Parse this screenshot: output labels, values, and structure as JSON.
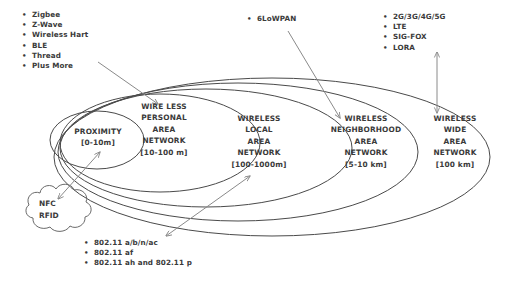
{
  "diagram": {
    "zones": [
      {
        "id": "proximity",
        "lines": [
          "PROXIMITY",
          "[0-10m]"
        ]
      },
      {
        "id": "wpan",
        "lines": [
          "WIRE LESS",
          "PERSONAL",
          "AREA",
          "NETWORK",
          "[10-100 m]"
        ]
      },
      {
        "id": "wlan",
        "lines": [
          "WIRELESS",
          "LOCAL",
          "AREA",
          "NETWORK",
          "[100-1000m]"
        ]
      },
      {
        "id": "wnan",
        "lines": [
          "WIRELESS",
          "NEIGHBORHOOD",
          "AREA",
          "NETWORK",
          "[5-10 km]"
        ]
      },
      {
        "id": "wwan",
        "lines": [
          "WIRELESS",
          "WIDE",
          "AREA",
          "NETWORK",
          "[100 km]"
        ]
      }
    ],
    "cloud": {
      "id": "nfc-rfid-cloud",
      "lines": [
        "NFC",
        "RFID"
      ]
    },
    "lists": {
      "wpan_technologies": {
        "bullet": "•",
        "items": [
          "Zigbee",
          "Z-Wave",
          "Wireless Hart",
          "BLE",
          "Thread",
          "Plus More"
        ]
      },
      "wnan_technologies": {
        "bullet": "•",
        "items": [
          "6LoWPAN"
        ]
      },
      "wwan_technologies": {
        "bullet": "•",
        "items": [
          "2G/3G/4G/5G",
          "LTE",
          "SIG-FOX",
          "LORA"
        ]
      },
      "wlan_technologies": {
        "bullet": "•",
        "items": [
          "802.11 a/b/n/ac",
          "802.11 af",
          "802.11 ah and 802.11 p"
        ]
      }
    },
    "colors": {
      "ellipse_stroke": "#4a4a4a",
      "arrow_stroke": "#8a8a8a",
      "text": "#3a3a3a",
      "background": "#ffffff"
    }
  }
}
